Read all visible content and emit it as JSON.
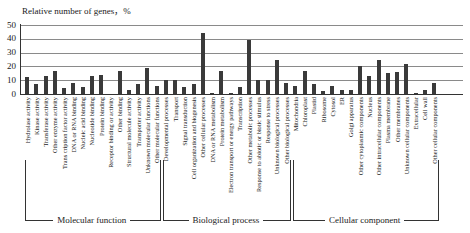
{
  "chart_data": {
    "type": "bar",
    "title": "",
    "ylabel": "Relative number of genes，%",
    "xlabel": "",
    "ylim": [
      0,
      50
    ],
    "yticks": [
      0,
      10,
      20,
      30,
      40,
      50
    ],
    "grid": true,
    "groups": [
      {
        "name": "Molecular function",
        "start": 0,
        "end": 14
      },
      {
        "name": "Biological process",
        "start": 15,
        "end": 28
      },
      {
        "name": "Cellular component",
        "start": 29,
        "end": 44
      }
    ],
    "categories": [
      "Hydrolase activity",
      "Kinase activity",
      "Transferase activity",
      "Other enzyme activity",
      "Trans cription factor activity",
      "DNA or RNA binding",
      "Nucleic acid binding",
      "Nucleotide binding",
      "Protein binding",
      "Receptor binding or activity",
      "Other binding",
      "Structural molecule activity",
      "Transporter activity",
      "Unknown molecular functions",
      "Other molecular functions",
      "Developmental processes",
      "Transport",
      "Signal transduction",
      "Cell organization and biogenesis",
      "Other cellular processes",
      "DNA or RNA metabolism",
      "Protein metabolism",
      "Electron transport or energy pathways",
      "Transcription",
      "Other metabolic processes",
      "Response to abiotic or biotic stimulus",
      "Response to stress",
      "Unknown biological processes",
      "Other biological processes",
      "Mitochondria",
      "Chloroplast",
      "Plastid",
      "Ribosome",
      "Cytosol",
      "ER",
      "Golgi apparatus",
      "Other cytoplasmic components",
      "Nucleus",
      "Other intracellular components",
      "Plasma membrane",
      "Other membranes",
      "Unknown cellular components",
      "Extracellular",
      "Cell wall",
      "Other cellular components"
    ],
    "values": [
      12,
      7,
      13,
      17,
      4,
      8,
      5,
      13,
      14,
      0,
      17,
      3,
      7,
      19,
      6,
      10,
      10,
      5,
      7,
      44,
      1,
      17,
      0.5,
      5,
      39,
      10,
      10,
      25,
      8,
      6,
      17,
      7,
      2,
      6,
      3,
      3,
      20,
      13,
      25,
      15,
      16,
      22,
      1,
      3,
      8
    ]
  }
}
